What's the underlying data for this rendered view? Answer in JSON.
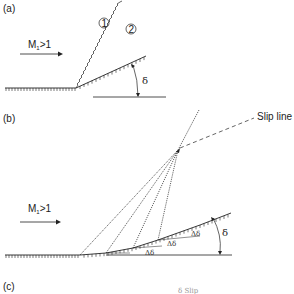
{
  "panels": {
    "a": {
      "label": "(a)",
      "flow_label": "M",
      "flow_sub": "1",
      "flow_cond": ">1",
      "region1": "1",
      "region2": "2",
      "angle": "δ"
    },
    "b": {
      "label": "(b)",
      "flow_label": "M",
      "flow_sub": "1",
      "flow_cond": ">1",
      "slip_line": "Slip line",
      "delta_increments": [
        "Δδ",
        "Δδ",
        "Δδ"
      ],
      "angle": "δ"
    },
    "c": {
      "label": "(c)",
      "partial_text": "δ Slip ..."
    }
  },
  "colors": {
    "stroke": "#222222",
    "background": "#ffffff"
  }
}
